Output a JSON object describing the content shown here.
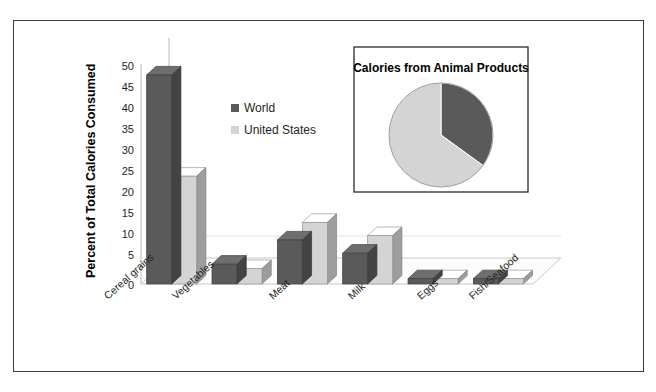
{
  "chart_data": {
    "type": "bar",
    "title": "",
    "xlabel": "",
    "ylabel": "Percent of Total Calories Consumed",
    "ylim": [
      0,
      50
    ],
    "yticks": [
      0,
      5,
      10,
      15,
      20,
      25,
      30,
      35,
      40,
      45,
      50
    ],
    "grid": false,
    "legend_position": "upper-center",
    "categories": [
      "Cereal grains",
      "Vegetables",
      "Meat",
      "Milk",
      "Eggs",
      "Fish/Seafood"
    ],
    "series": [
      {
        "name": "World",
        "values": [
          47.5,
          4.5,
          10.0,
          7.0,
          1.2,
          1.2
        ],
        "color": "#5a5a5a"
      },
      {
        "name": "United States",
        "values": [
          24.5,
          3.5,
          14.0,
          11.0,
          1.2,
          1.2
        ],
        "color": "#d4d4d4"
      }
    ],
    "inset": {
      "type": "pie",
      "title": "Calories from Animal Products",
      "labels": [
        "Animal products",
        "Other"
      ],
      "values": [
        35,
        65
      ],
      "colors": [
        "#5a5a5a",
        "#d4d4d4"
      ]
    }
  },
  "axis": {
    "tick_0": "0",
    "tick_5": "5",
    "tick_10": "10",
    "tick_15": "15",
    "tick_20": "20",
    "tick_25": "25",
    "tick_30": "30",
    "tick_35": "35",
    "tick_40": "40",
    "tick_45": "45",
    "tick_50": "50"
  },
  "categories": {
    "c0": "Cereal grains",
    "c1": "Vegetables",
    "c2": "Meat",
    "c3": "Milk",
    "c4": "Eggs",
    "c5": "Fish/Seafood"
  },
  "legend": {
    "world": "World",
    "united_states": "United States"
  },
  "ytitle": "Percent of Total Calories Consumed",
  "inset": {
    "title": "Calories from Animal Products"
  },
  "colors": {
    "series_world": "#5a5a5a",
    "series_us": "#d4d4d4",
    "frame": "#3a3a3a",
    "axis_line": "#b8b8b8"
  }
}
